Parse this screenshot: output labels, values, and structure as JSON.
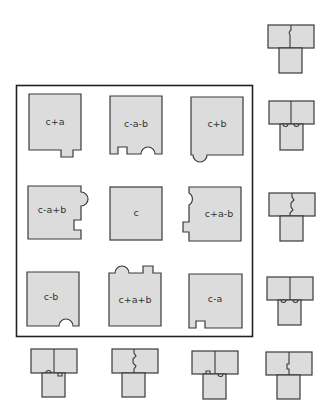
{
  "diagram": {
    "colors": {
      "tile_fill": "#dcdcdc",
      "stroke": "#3a3a3a",
      "frame": "#222222",
      "background": "#ffffff"
    },
    "grid_tiles": [
      {
        "label": "c+a",
        "row": 0,
        "col": 0,
        "features": [
          "square tab bottom-right (out)"
        ]
      },
      {
        "label": "c-a-b",
        "row": 0,
        "col": 1,
        "features": [
          "square notch bottom-left (in)",
          "round notch bottom-right (in)"
        ]
      },
      {
        "label": "c+b",
        "row": 0,
        "col": 2,
        "features": [
          "round tab bottom-left (out)"
        ]
      },
      {
        "label": "c-a+b",
        "row": 1,
        "col": 0,
        "features": [
          "round tab right-top (out)",
          "square notch right-bottom (in)"
        ]
      },
      {
        "label": "c",
        "row": 1,
        "col": 1,
        "features": []
      },
      {
        "label": "c+a-b",
        "row": 1,
        "col": 2,
        "features": [
          "round notch left-top (in)",
          "square tab left-bottom (out)"
        ]
      },
      {
        "label": "c-b",
        "row": 2,
        "col": 0,
        "features": [
          "round notch bottom-right (in)"
        ]
      },
      {
        "label": "c+a+b",
        "row": 2,
        "col": 1,
        "features": [
          "round tab top-left (out)",
          "square tab top-right (out)"
        ]
      },
      {
        "label": "c-a",
        "row": 2,
        "col": 2,
        "features": [
          "square notch bottom-left (in)"
        ]
      }
    ],
    "assemblies": [
      {
        "id": "right-1",
        "position": "right column, 1",
        "seam": "vertical, single bump"
      },
      {
        "id": "right-2",
        "position": "right column, 2",
        "seam": "horizontal, two bumps"
      },
      {
        "id": "right-3",
        "position": "right column, 3",
        "seam": "vertical, zigzag"
      },
      {
        "id": "right-4",
        "position": "right column, 4",
        "seam": "horizontal, two bumps"
      },
      {
        "id": "right-5",
        "position": "right column, 5",
        "seam": "vertical, square step"
      },
      {
        "id": "bottom-1",
        "position": "bottom row, 1",
        "seam": "horizontal, bump + notch"
      },
      {
        "id": "bottom-2",
        "position": "bottom row, 2",
        "seam": "vertical, zigzag"
      },
      {
        "id": "bottom-3",
        "position": "bottom row, 3",
        "seam": "horizontal, square + round"
      }
    ]
  }
}
